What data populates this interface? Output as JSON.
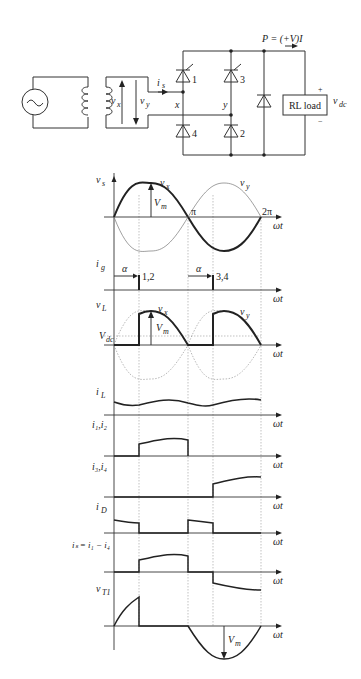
{
  "circuit": {
    "power_label": "P = (+V)I",
    "source_symbol": "~",
    "vx_label": "v",
    "vx_sub": "x",
    "vy_label": "v",
    "vy_sub": "y",
    "is_label": "i",
    "is_sub": "s",
    "node_x": "x",
    "node_y": "y",
    "thyristor_1": "1",
    "thyristor_3": "3",
    "diode_4": "4",
    "diode_2": "2",
    "load_label": "RL load",
    "plus": "+",
    "minus": "−",
    "vdc_label": "v",
    "vdc_sub": "dc"
  },
  "waveforms": {
    "wt": "ωt",
    "pi": "π",
    "two_pi": "2π",
    "vm": "V",
    "vm_sub": "m",
    "alpha": "α",
    "gate_12": "1,2",
    "gate_34": "3,4",
    "rows": [
      {
        "label": "v",
        "sub": "s"
      },
      {
        "label": "i",
        "sub": "g"
      },
      {
        "label": "v",
        "sub": "L"
      },
      {
        "label": "i",
        "sub": "L"
      },
      {
        "label": "i₁,i₂",
        "sub": ""
      },
      {
        "label": "i₃,i₄",
        "sub": ""
      },
      {
        "label": "i",
        "sub": "D"
      },
      {
        "label": "iₛ = i₁ − i₄",
        "sub": ""
      },
      {
        "label": "v",
        "sub": "T1"
      }
    ],
    "vdc_label": "V",
    "vdc_sub": "dc",
    "vx_curve": "v",
    "vx_curve_sub": "x",
    "vy_curve": "v",
    "vy_curve_sub": "y"
  }
}
